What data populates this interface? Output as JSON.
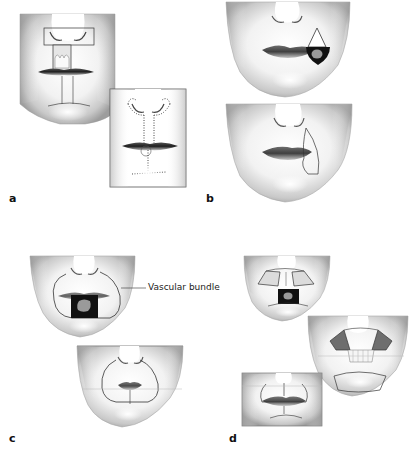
{
  "figure": {
    "panels": [
      {
        "id": "a",
        "label": "a",
        "description": "Upper lip flap exposure with teeth and inset showing dotted incision lines"
      },
      {
        "id": "b",
        "label": "b",
        "description": "Lateral lip defect (black wedge) with triangular flap design, then closure outline"
      },
      {
        "id": "c",
        "label": "c",
        "description": "Central lower lip defect with circumoral flap outline; vascular bundle callout; repaired result"
      },
      {
        "id": "d",
        "label": "d",
        "description": "Bilateral flap design for central defect, flap rotation, and final reconstruction"
      }
    ],
    "annotations": {
      "vascular_bundle": "Vascular bundle"
    }
  },
  "colors": {
    "background": "#ffffff",
    "line": "#333333",
    "shade_dark": "#8a8a8a",
    "shade_light": "#d9d9d9",
    "defect": "#111111",
    "defect_inner": "#9a9a9a",
    "label": "#111111"
  }
}
